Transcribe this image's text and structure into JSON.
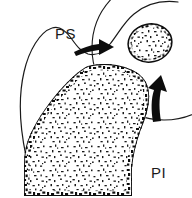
{
  "figure": {
    "background_color": "#ffffff",
    "ink_color": "#111111",
    "labels": [
      {
        "id": "ps",
        "text": "PS",
        "x": 55,
        "y": 26,
        "meaning": "periosteal-surface-label"
      },
      {
        "id": "pi",
        "text": "PI",
        "x": 151,
        "y": 165,
        "meaning": "periosteal-interface-label"
      }
    ],
    "arrows": [
      {
        "id": "arrow-right",
        "direction": "right",
        "points_to": "inset-circle",
        "x": 75,
        "y": 40
      },
      {
        "id": "arrow-up",
        "direction": "up-right",
        "points_to": "bone-mass-edge",
        "x": 155,
        "y": 85
      }
    ],
    "shapes": [
      {
        "id": "outer-contour",
        "type": "thin-curve",
        "description": "wavy soft-tissue outline sweeping from lower-left up and over to the right"
      },
      {
        "id": "bone-mass",
        "type": "stippled-polygon",
        "description": "large speckled trabecular bone region occupying lower-left"
      },
      {
        "id": "inset-circle",
        "type": "circle",
        "description": "magnified circular inset in upper right, cropped by image edge"
      },
      {
        "id": "inset-oval",
        "type": "stippled-oval",
        "description": "small speckled trabecular fragment inside the inset circle"
      }
    ]
  }
}
